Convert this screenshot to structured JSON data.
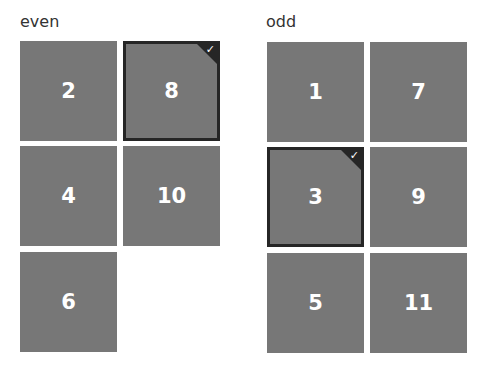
{
  "colors": {
    "tile_bg": "#777777",
    "selected_border": "#262626",
    "text": "#ffffff",
    "title": "#333333"
  },
  "groups": [
    {
      "title": "even",
      "tiles": [
        {
          "label": "2",
          "selected": false
        },
        {
          "label": "8",
          "selected": true
        },
        {
          "label": "4",
          "selected": false
        },
        {
          "label": "10",
          "selected": false
        },
        {
          "label": "6",
          "selected": false
        }
      ]
    },
    {
      "title": "odd",
      "tiles": [
        {
          "label": "1",
          "selected": false
        },
        {
          "label": "7",
          "selected": false
        },
        {
          "label": "3",
          "selected": true
        },
        {
          "label": "9",
          "selected": false
        },
        {
          "label": "5",
          "selected": false
        },
        {
          "label": "11",
          "selected": false
        }
      ]
    }
  ],
  "check_glyph": "✓"
}
